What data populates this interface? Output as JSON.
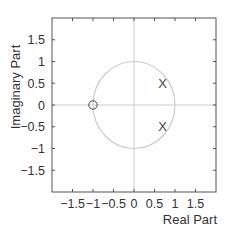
{
  "chart_data": {
    "type": "scatter",
    "title": "",
    "subtitle": "",
    "xlabel": "Real Part",
    "ylabel": "Imaginary Part",
    "xlim": [
      -2,
      2
    ],
    "ylim": [
      -2,
      2
    ],
    "grid": false,
    "legend": null,
    "x_ticks": [
      -1.5,
      -1,
      -0.5,
      0,
      0.5,
      1,
      1.5
    ],
    "x_tick_labels": [
      "−1.5",
      "−1",
      "−0.5",
      "0",
      "0.5",
      "1",
      "1.5"
    ],
    "y_ticks": [
      1.5,
      1,
      0.5,
      0,
      -0.5,
      -1,
      -1.5
    ],
    "y_tick_labels": [
      "1.5",
      "1",
      "0.5",
      "0",
      "−0.5",
      "−1",
      "−1.5"
    ],
    "unit_circle": {
      "center": [
        0,
        0
      ],
      "radius": 1,
      "color": "#cccccc"
    },
    "reference_axes": {
      "color": "#cccccc"
    },
    "series": [
      {
        "name": "zeros",
        "marker": "o",
        "points": [
          [
            -1,
            0
          ]
        ]
      },
      {
        "name": "poles",
        "marker": "x",
        "points": [
          [
            0.7,
            0.5
          ],
          [
            0.7,
            -0.5
          ]
        ]
      }
    ]
  },
  "colors": {
    "axes": "#555555",
    "text": "#333333",
    "guide": "#cccccc",
    "marker": "#444444"
  }
}
